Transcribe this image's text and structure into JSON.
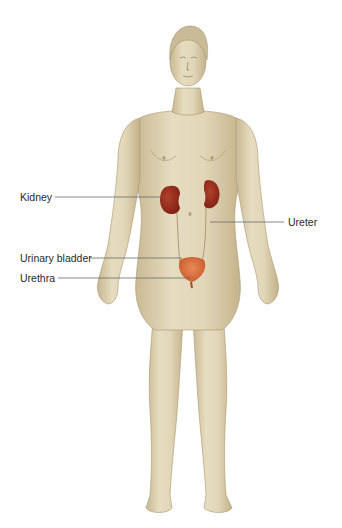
{
  "diagram": {
    "colors": {
      "background": "#ffffff",
      "skin": "#ddd0b0",
      "skin_shadow": "#bfae88",
      "hair": "#c9bb98",
      "kidney": "#9a2a1c",
      "bladder": "#d86a3a",
      "leader_line": "#6b6b6b",
      "label_text": "#2a2a2a"
    },
    "labels": [
      {
        "id": "kidney",
        "text": "Kidney",
        "side": "left"
      },
      {
        "id": "ureter",
        "text": "Ureter",
        "side": "right"
      },
      {
        "id": "urinary_bladder",
        "text": "Urinary bladder",
        "side": "left"
      },
      {
        "id": "urethra",
        "text": "Urethra",
        "side": "left"
      }
    ]
  }
}
